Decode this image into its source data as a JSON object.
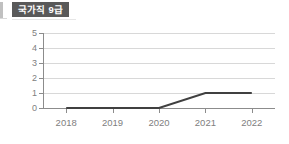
{
  "widget": {
    "title": "국가직 9급",
    "title_bg_color": "#595959",
    "title_text_color": "#ffffff"
  },
  "chart_data": {
    "type": "line",
    "title": "국가직 9급",
    "xlabel": "",
    "ylabel": "",
    "categories": [
      "2018",
      "2019",
      "2020",
      "2021",
      "2022"
    ],
    "x": [
      2018,
      2019,
      2020,
      2021,
      2022
    ],
    "series": [
      {
        "name": "국가직 9급",
        "values": [
          0,
          0,
          0,
          1,
          1
        ],
        "color": "#404040"
      }
    ],
    "ylim": [
      0,
      5
    ],
    "yticks": [
      0,
      1,
      2,
      3,
      4,
      5
    ],
    "ytick_labels": [
      "0",
      "1",
      "2",
      "3",
      "4",
      "5"
    ],
    "xtick_labels": [
      "2018",
      "2019",
      "2020",
      "2021",
      "2022"
    ],
    "grid": true,
    "grid_axis": "y",
    "grid_color": "#d8d8d8",
    "legend": false,
    "legend_position": "none",
    "markers": false,
    "axis_color": "#8c8c8c",
    "tick_label_color": "#808080"
  }
}
